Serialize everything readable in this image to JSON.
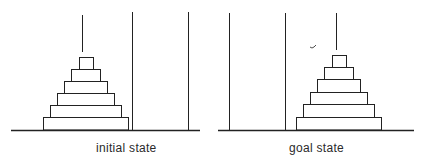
{
  "diagram": {
    "type": "tower-of-hanoi",
    "colors": {
      "stroke": "#222222",
      "background": "#ffffff"
    },
    "panels": [
      {
        "id": "initial",
        "label": "initial state",
        "pegs": 3,
        "disks_on_peg": 1,
        "disk_count": 6
      },
      {
        "id": "goal",
        "label": "goal state",
        "pegs": 3,
        "disks_on_peg": 3,
        "disk_count": 6
      }
    ]
  }
}
